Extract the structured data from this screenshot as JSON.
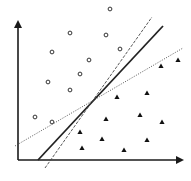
{
  "diagram": {
    "title": "",
    "axes": {
      "origin": [
        18,
        160
      ],
      "y_axis_top": [
        18,
        20
      ],
      "x_axis_end": [
        184,
        160
      ],
      "color": "#1a1a1a"
    },
    "class_circles": [
      [
        110,
        9
      ],
      [
        70,
        33
      ],
      [
        106,
        35
      ],
      [
        120,
        49
      ],
      [
        52,
        52
      ],
      [
        89,
        60
      ],
      [
        80,
        74
      ],
      [
        48,
        82
      ],
      [
        70,
        90
      ],
      [
        35,
        117
      ],
      [
        52,
        122
      ]
    ],
    "class_triangles": [
      [
        178,
        60
      ],
      [
        161,
        66
      ],
      [
        147,
        93
      ],
      [
        117,
        97
      ],
      [
        106,
        119
      ],
      [
        140,
        115
      ],
      [
        162,
        122
      ],
      [
        80,
        132
      ],
      [
        102,
        139
      ],
      [
        147,
        140
      ],
      [
        82,
        148
      ],
      [
        124,
        150
      ]
    ],
    "lines": [
      {
        "name": "optimal-boundary",
        "style": "solid",
        "from": [
          38,
          160
        ],
        "to": [
          163,
          26
        ]
      },
      {
        "name": "steep-boundary",
        "style": "dashed",
        "from": [
          45,
          168
        ],
        "to": [
          152,
          17
        ]
      },
      {
        "name": "shallow-boundary",
        "style": "dotted",
        "from": [
          15,
          146
        ],
        "to": [
          183,
          48
        ]
      }
    ]
  }
}
